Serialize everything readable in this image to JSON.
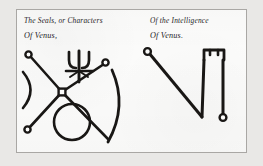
{
  "plate": {
    "name": "venus-seals-plate",
    "background_color": "#fbfbfa",
    "border_color": "#a9a7a4",
    "ink_color": "#191715",
    "margin_color": "#e9e8e6"
  },
  "captions": {
    "left_line1": "The Seals, or Characters",
    "left_line2": "Of Venus,",
    "right_line1": "Of the Intelligence",
    "right_line2": "Of Venus."
  },
  "figures": [
    {
      "id": "seal-of-venus",
      "label": "The Seals, or Characters Of Venus,",
      "elements": [
        "x-cross-with-four-ringed-arms",
        "central-square-node",
        "psi-trident-glyph",
        "left-crescent-arc",
        "right-crescent-arc",
        "bottom-circle"
      ]
    },
    {
      "id": "intelligence-of-venus",
      "label": "Of the Intelligence Of Venus.",
      "elements": [
        "diagonal-stroke-with-top-ring",
        "vertical-stroke-with-bottom-ring",
        "squared-arch-bracket"
      ]
    }
  ]
}
